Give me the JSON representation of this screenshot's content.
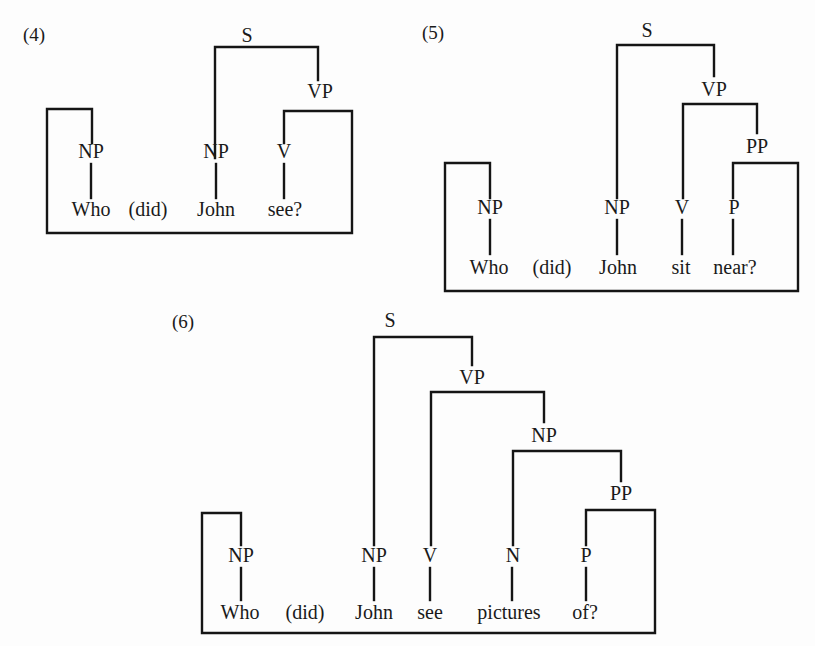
{
  "figure": {
    "diagrams": [
      {
        "id": "ex4",
        "number": "(4)",
        "number_pos": [
          23,
          41
        ],
        "sentence": [
          "Who",
          "(did)",
          "John",
          "see?"
        ],
        "words": [
          {
            "text": "Who",
            "x": 91,
            "y": 216
          },
          {
            "text": "(did)",
            "x": 148,
            "y": 216
          },
          {
            "text": "John",
            "x": 216,
            "y": 216
          },
          {
            "text": "see?",
            "x": 285,
            "y": 216
          }
        ],
        "nodes": [
          {
            "label": "S",
            "x": 247,
            "y": 42
          },
          {
            "label": "VP",
            "x": 320,
            "y": 98
          },
          {
            "label": "NP",
            "x": 91,
            "y": 158
          },
          {
            "label": "NP",
            "x": 216,
            "y": 158
          },
          {
            "label": "V",
            "x": 284,
            "y": 158
          }
        ],
        "edges": [
          "M215 158 L215 47 L318 47 L318 80",
          "M91 164 L91 198",
          "M216 164 L216 198",
          "M284 164 L284 198",
          "M284 143 L284 111 L352 111 L352 233 L47 233 L47 109 L92 109 L92 143"
        ]
      },
      {
        "id": "ex5",
        "number": "(5)",
        "number_pos": [
          422,
          39
        ],
        "sentence": [
          "Who",
          "(did)",
          "John",
          "sit",
          "near?"
        ],
        "words": [
          {
            "text": "Who",
            "x": 489,
            "y": 274
          },
          {
            "text": "(did)",
            "x": 552,
            "y": 274
          },
          {
            "text": "John",
            "x": 618,
            "y": 274
          },
          {
            "text": "sit",
            "x": 681,
            "y": 274
          },
          {
            "text": "near?",
            "x": 735,
            "y": 274
          }
        ],
        "nodes": [
          {
            "label": "S",
            "x": 647,
            "y": 37
          },
          {
            "label": "VP",
            "x": 714,
            "y": 96
          },
          {
            "label": "PP",
            "x": 757,
            "y": 153
          },
          {
            "label": "NP",
            "x": 490,
            "y": 214
          },
          {
            "label": "NP",
            "x": 617,
            "y": 214
          },
          {
            "label": "V",
            "x": 682,
            "y": 214
          },
          {
            "label": "P",
            "x": 734,
            "y": 214
          }
        ],
        "edges": [
          "M617 198 L617 45 L714 45 L714 76",
          "M683 198 L683 104 L757 104 L757 133",
          "M490 220 L490 254",
          "M617 220 L617 254",
          "M682 220 L682 254",
          "M733 220 L733 254",
          "M733 198 L733 163 L798 163 L798 291 L445 291 L445 163 L490 163 L490 198"
        ]
      },
      {
        "id": "ex6",
        "number": "(6)",
        "number_pos": [
          172,
          328
        ],
        "sentence": [
          "Who",
          "(did)",
          "John",
          "see",
          "pictures",
          "of?"
        ],
        "words": [
          {
            "text": "Who",
            "x": 240,
            "y": 619
          },
          {
            "text": "(did)",
            "x": 305,
            "y": 619
          },
          {
            "text": "John",
            "x": 374,
            "y": 619
          },
          {
            "text": "see",
            "x": 430,
            "y": 619
          },
          {
            "text": "pictures",
            "x": 509,
            "y": 619
          },
          {
            "text": "of?",
            "x": 585,
            "y": 619
          }
        ],
        "nodes": [
          {
            "label": "S",
            "x": 390,
            "y": 327
          },
          {
            "label": "VP",
            "x": 472,
            "y": 384
          },
          {
            "label": "NP",
            "x": 544,
            "y": 442
          },
          {
            "label": "PP",
            "x": 621,
            "y": 500
          },
          {
            "label": "NP",
            "x": 241,
            "y": 562
          },
          {
            "label": "NP",
            "x": 374,
            "y": 562
          },
          {
            "label": "V",
            "x": 430,
            "y": 562
          },
          {
            "label": "N",
            "x": 513,
            "y": 562
          },
          {
            "label": "P",
            "x": 586,
            "y": 562
          }
        ],
        "edges": [
          "M374 545 L374 337 L472 337 L472 365",
          "M431 545 L431 392 L544 392 L544 422",
          "M513 545 L513 451 L621 451 L621 481",
          "M241 568 L241 600",
          "M374 568 L374 600",
          "M430 568 L430 600",
          "M512 568 L512 600",
          "M586 568 L586 600",
          "M586 545 L586 510 L655 510 L655 633 L202 633 L202 513 L241 513 L241 545"
        ]
      }
    ]
  }
}
